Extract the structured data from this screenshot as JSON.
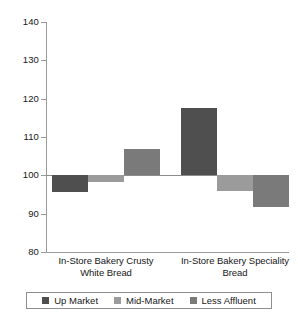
{
  "chart_data": {
    "type": "bar",
    "title": "",
    "subtitle": "",
    "xlabel": "",
    "ylabel": "",
    "ylim": [
      80,
      140
    ],
    "yticks": [
      80,
      90,
      100,
      110,
      120,
      130,
      140
    ],
    "ytick_labels": [
      "80",
      "90",
      "100",
      "110",
      "120",
      "130",
      "140"
    ],
    "grid": false,
    "baseline": 100,
    "legend_position": "bottom",
    "categories": [
      "In-Store Bakery Crusty White Bread",
      "In-Store Bakery Speciality Bread"
    ],
    "category_lines": [
      [
        "In-Store Bakery Crusty",
        "White Bread"
      ],
      [
        "In-Store Bakery Speciality",
        "Bread"
      ]
    ],
    "series": [
      {
        "name": "Up Market",
        "color": "#4f4f4f",
        "values": [
          95.6,
          117.5
        ]
      },
      {
        "name": "Mid-Market",
        "color": "#9b9b9b",
        "values": [
          98.2,
          95.8
        ]
      },
      {
        "name": "Less Affluent",
        "color": "#7a7a7a",
        "values": [
          107.0,
          91.7
        ]
      }
    ]
  },
  "legend": {
    "items": [
      {
        "label": "Up Market",
        "color": "#4f4f4f"
      },
      {
        "label": "Mid-Market",
        "color": "#9b9b9b"
      },
      {
        "label": "Less Affluent",
        "color": "#7a7a7a"
      }
    ]
  }
}
